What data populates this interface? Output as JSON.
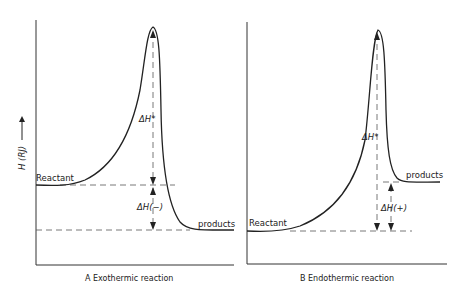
{
  "figure": {
    "y_axis_label": "H (RJ)",
    "panels": [
      {
        "id": "A",
        "caption": "A   Exothermic reaction",
        "reactant_label": "Reactant",
        "products_label": "products",
        "activation_label": "ΔH*",
        "enthalpy_label": "ΔH(−)",
        "reactant_level": "high",
        "products_level": "low"
      },
      {
        "id": "B",
        "caption": "B   Endothermic reaction",
        "reactant_label": "Reactant",
        "products_label": "products",
        "activation_label": "ΔH*",
        "enthalpy_label": "ΔH(+)",
        "reactant_level": "low",
        "products_level": "high"
      }
    ]
  }
}
